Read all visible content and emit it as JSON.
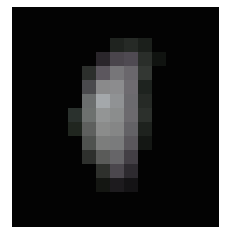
{
  "image": {
    "description": "Low-resolution pixelated grayscale blob on black background",
    "background": "#030303",
    "frame": {
      "x": 12,
      "y": 7,
      "w": 207,
      "h": 220
    },
    "grid": {
      "origin_x": 56,
      "origin_y": 31,
      "cell": 14
    },
    "pixels": [
      {
        "c": 3,
        "r": 0,
        "color": "#1f231f"
      },
      {
        "c": 4,
        "r": 0,
        "color": "#262a26"
      },
      {
        "c": 5,
        "r": 0,
        "color": "#1b1f1b"
      },
      {
        "c": 2,
        "r": 1,
        "color": "#2a262b"
      },
      {
        "c": 3,
        "r": 1,
        "color": "#4a454c"
      },
      {
        "c": 4,
        "r": 1,
        "color": "#4f4a52"
      },
      {
        "c": 5,
        "r": 1,
        "color": "#2a2e2a"
      },
      {
        "c": 6,
        "r": 1,
        "color": "#101310"
      },
      {
        "c": 1,
        "r": 2,
        "color": "#2c2f2c"
      },
      {
        "c": 2,
        "r": 2,
        "color": "#5c575e"
      },
      {
        "c": 3,
        "r": 2,
        "color": "#777679"
      },
      {
        "c": 4,
        "r": 2,
        "color": "#6a676c"
      },
      {
        "c": 5,
        "r": 2,
        "color": "#333733"
      },
      {
        "c": 1,
        "r": 3,
        "color": "#4a4a4d"
      },
      {
        "c": 2,
        "r": 3,
        "color": "#8a8a8b"
      },
      {
        "c": 3,
        "r": 3,
        "color": "#8c8c8e"
      },
      {
        "c": 4,
        "r": 3,
        "color": "#6e6b70"
      },
      {
        "c": 5,
        "r": 3,
        "color": "#1e231f"
      },
      {
        "c": 1,
        "r": 4,
        "color": "#6b6e6e"
      },
      {
        "c": 2,
        "r": 4,
        "color": "#a4a8ab"
      },
      {
        "c": 3,
        "r": 4,
        "color": "#909294"
      },
      {
        "c": 4,
        "r": 4,
        "color": "#6b6a6e"
      },
      {
        "c": 5,
        "r": 4,
        "color": "#262a26"
      },
      {
        "c": 0,
        "r": 5,
        "color": "#2a312d"
      },
      {
        "c": 1,
        "r": 5,
        "color": "#6d716f"
      },
      {
        "c": 2,
        "r": 5,
        "color": "#939595"
      },
      {
        "c": 3,
        "r": 5,
        "color": "#8b8d8d"
      },
      {
        "c": 4,
        "r": 5,
        "color": "#6c6a6e"
      },
      {
        "c": 5,
        "r": 5,
        "color": "#2c302c"
      },
      {
        "c": 0,
        "r": 6,
        "color": "#20261f"
      },
      {
        "c": 1,
        "r": 6,
        "color": "#5e605e"
      },
      {
        "c": 2,
        "r": 6,
        "color": "#8b8c8b"
      },
      {
        "c": 3,
        "r": 6,
        "color": "#858686"
      },
      {
        "c": 4,
        "r": 6,
        "color": "#636266"
      },
      {
        "c": 5,
        "r": 6,
        "color": "#1e221e"
      },
      {
        "c": 1,
        "r": 7,
        "color": "#4f524f"
      },
      {
        "c": 2,
        "r": 7,
        "color": "#7c7d7c"
      },
      {
        "c": 3,
        "r": 7,
        "color": "#7a7b7c"
      },
      {
        "c": 4,
        "r": 7,
        "color": "#5a575c"
      },
      {
        "c": 5,
        "r": 7,
        "color": "#141714"
      },
      {
        "c": 1,
        "r": 8,
        "color": "#2e302d"
      },
      {
        "c": 2,
        "r": 8,
        "color": "#5a5b59"
      },
      {
        "c": 3,
        "r": 8,
        "color": "#666568"
      },
      {
        "c": 4,
        "r": 8,
        "color": "#433f45"
      },
      {
        "c": 2,
        "r": 9,
        "color": "#2e302c"
      },
      {
        "c": 3,
        "r": 9,
        "color": "#4b474d"
      },
      {
        "c": 4,
        "r": 9,
        "color": "#2d2a2f"
      },
      {
        "c": 2,
        "r": 10,
        "color": "#141612"
      },
      {
        "c": 3,
        "r": 10,
        "color": "#1d1b1e"
      },
      {
        "c": 4,
        "r": 10,
        "color": "#141315"
      }
    ]
  }
}
